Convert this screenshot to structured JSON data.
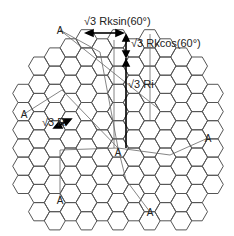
{
  "diagram": {
    "type": "hexagonal-cell-grid",
    "cell_label": "A",
    "colors": {
      "grid": "#555555",
      "lines": "#555555",
      "text": "#222222",
      "arrows": "#000000"
    },
    "annotations": {
      "rk_sin": "√3 Rksin(60°)",
      "rk_cos": "√3 Rkcos(60°)",
      "ri": "√3 Ri",
      "r": "√3 R"
    },
    "cells": [
      {
        "label": "A",
        "x": 60,
        "y": 30
      },
      {
        "label": "A",
        "x": 24,
        "y": 114
      },
      {
        "label": "A",
        "x": 118,
        "y": 152
      },
      {
        "label": "A",
        "x": 60,
        "y": 200
      },
      {
        "label": "A",
        "x": 150,
        "y": 212
      },
      {
        "label": "A",
        "x": 208,
        "y": 138
      }
    ]
  }
}
